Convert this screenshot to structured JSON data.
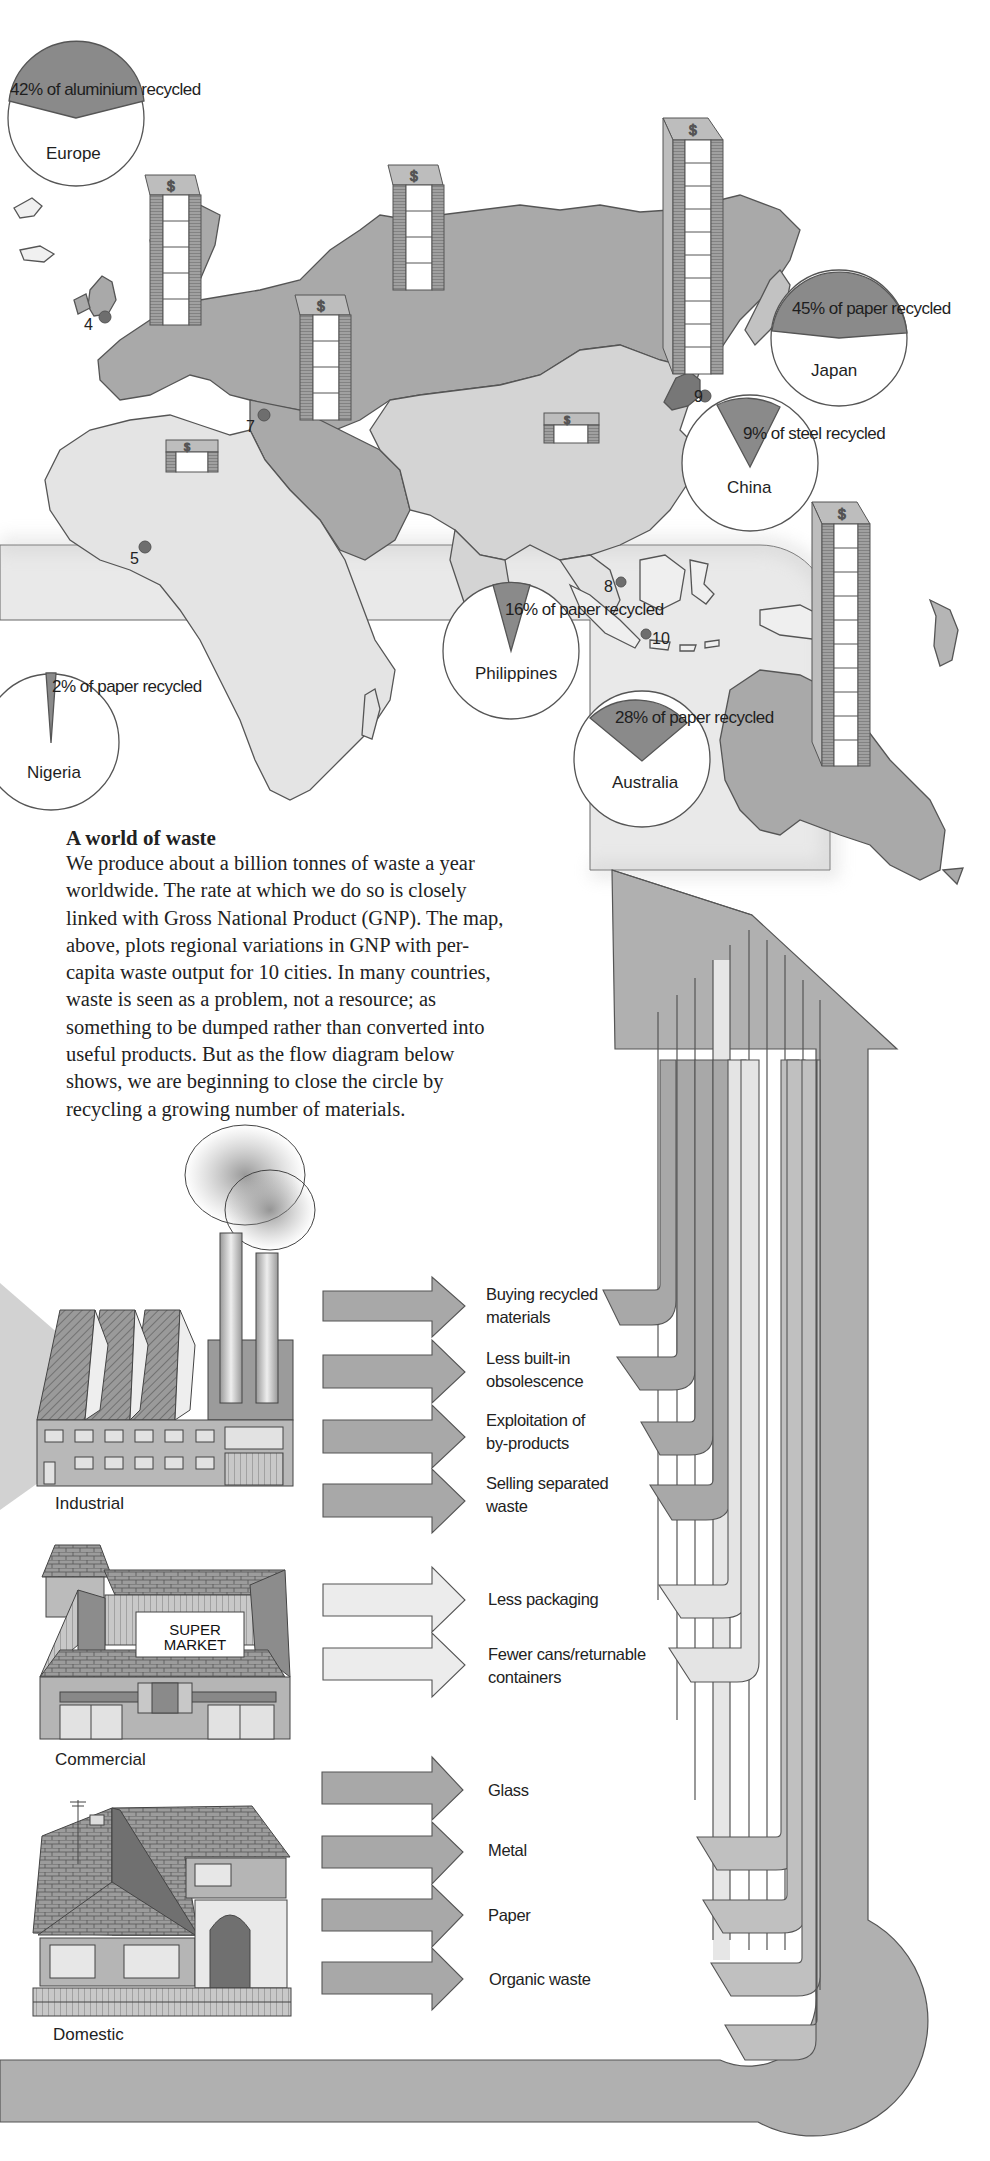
{
  "article": {
    "title": "A world of waste",
    "body": "We produce about a billion tonnes of waste a year worldwide. The rate at which we do so is closely linked with Gross National Product (GNP). The map, above, plots regional variations in GNP with per-capita waste output for 10 cities. In many countries, waste is seen as a problem, not a resource; as something to be dumped rather than converted into useful products. But as the flow diagram below shows, we are beginning to close the circle by recycling a growing number of materials."
  },
  "map": {
    "pies": [
      {
        "country": "Europe",
        "label": "42% of aluminium recycled",
        "percent": 42
      },
      {
        "country": "Japan",
        "label": "45% of paper recycled",
        "percent": 45
      },
      {
        "country": "China",
        "label": "9% of steel recycled",
        "percent": 9
      },
      {
        "country": "Philippines",
        "label": "16% of paper recycled",
        "percent": 16
      },
      {
        "country": "Australia",
        "label": "28% of paper recycled",
        "percent": 28
      },
      {
        "country": "Nigeria",
        "label": "2% of paper recycled",
        "percent": 2
      }
    ],
    "cities": [
      "4",
      "5",
      "7",
      "8",
      "9",
      "10"
    ],
    "gnp_stacks": [
      {
        "region": "Western Europe",
        "units": 5
      },
      {
        "region": "USSR",
        "units": 4
      },
      {
        "region": "Middle East",
        "units": 4
      },
      {
        "region": "Africa",
        "units": 1
      },
      {
        "region": "China",
        "units": 1
      },
      {
        "region": "Japan",
        "units": 10
      },
      {
        "region": "Australia",
        "units": 10
      }
    ],
    "stack_icon": "dollar-icon"
  },
  "flow": {
    "sources": [
      {
        "label": "Industrial",
        "sign": ""
      },
      {
        "label": "Commercial",
        "sign": "SUPER MARKET"
      },
      {
        "label": "Domestic",
        "sign": ""
      }
    ],
    "sign_line1": "SUPER",
    "sign_line2": "MARKET",
    "industrial_actions": [
      {
        "line1": "Buying recycled",
        "line2": "materials"
      },
      {
        "line1": "Less built-in",
        "line2": "obsolescence"
      },
      {
        "line1": "Exploitation of",
        "line2": "by-products"
      },
      {
        "line1": "Selling separated",
        "line2": "waste"
      }
    ],
    "commercial_actions": [
      {
        "line1": "Less packaging",
        "line2": ""
      },
      {
        "line1": "Fewer cans/returnable",
        "line2": "containers"
      }
    ],
    "domestic_actions": [
      {
        "line1": "Glass",
        "line2": ""
      },
      {
        "line1": "Metal",
        "line2": ""
      },
      {
        "line1": "Paper",
        "line2": ""
      },
      {
        "line1": "Organic waste",
        "line2": ""
      }
    ]
  },
  "colors": {
    "land_dark": "#a9a9a9",
    "land_mid": "#bdbdbd",
    "land_light": "#d9d9d9",
    "pie_slice": "#8a8a8a",
    "arrow_dark": "#acacac",
    "arrow_light": "#e8e8e8",
    "outline": "#4a4a4a"
  }
}
